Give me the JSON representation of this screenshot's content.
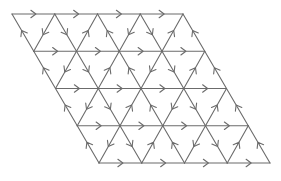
{
  "diagram": {
    "name": "triangular-lattice-oriented-edges",
    "colors": {
      "line": "#6b6b6b",
      "background": "#ffffff"
    },
    "lattice": {
      "rows": 4,
      "cols": 4,
      "origin": [
        12,
        14
      ],
      "edge_length": 42.75,
      "row_height": 37.25,
      "row_shift": 21.75
    },
    "orientation_rules": {
      "horizontal": "right",
      "backslash_even_col": "up",
      "backslash_odd_col": "down",
      "slash_even_col": "down",
      "slash_odd_col": "up"
    },
    "arrow_glyph": "open-chevron",
    "arrow_size": 5
  }
}
